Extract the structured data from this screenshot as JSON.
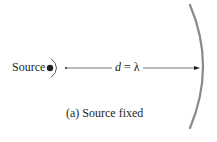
{
  "diagram": {
    "source_label": "Source",
    "distance_variable": "d",
    "distance_equals": " = ",
    "distance_value": "λ",
    "caption": "(a) Source fixed",
    "colors": {
      "text": "#231f20",
      "wall": "#8a8a8a",
      "line": "#555555",
      "source_dot": "#231f20"
    }
  }
}
